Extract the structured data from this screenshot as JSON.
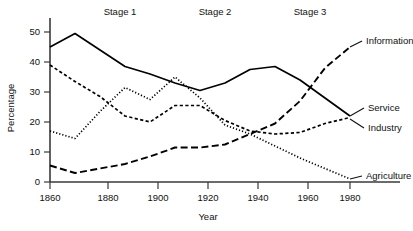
{
  "chart_data": {
    "type": "line",
    "title": "",
    "xlabel": "Year",
    "ylabel": "Percentage",
    "xlim": [
      1860,
      1980
    ],
    "ylim": [
      0,
      50
    ],
    "xticks": [
      1860,
      1880,
      1900,
      1920,
      1940,
      1960,
      1980
    ],
    "yticks": [
      0,
      10,
      20,
      30,
      40,
      50
    ],
    "grid": false,
    "legend_position": "right-inline-labels",
    "annotations": [
      {
        "text": "Stage 1",
        "x": 1875
      },
      {
        "text": "Stage 2",
        "x": 1920
      },
      {
        "text": "Stage 3",
        "x": 1958
      }
    ],
    "x": [
      1860,
      1870,
      1880,
      1890,
      1900,
      1910,
      1920,
      1930,
      1940,
      1950,
      1960,
      1970,
      1980
    ],
    "series": [
      {
        "name": "Service",
        "style": "solid",
        "values": [
          45,
          49.5,
          44,
          38.5,
          36,
          33,
          30.5,
          33,
          37.5,
          38.5,
          34,
          28,
          22
        ]
      },
      {
        "name": "Industry",
        "style": "dashed",
        "values": [
          39,
          33.5,
          28.5,
          22,
          20,
          25.5,
          25.5,
          20.5,
          17,
          16,
          16.5,
          19.5,
          21.5
        ]
      },
      {
        "name": "Agriculture",
        "style": "dotted",
        "values": [
          17,
          14.5,
          23.5,
          31.5,
          27.5,
          35,
          28,
          19,
          16,
          12,
          8,
          4.5,
          1
        ]
      },
      {
        "name": "Information",
        "style": "longdash",
        "values": [
          5.5,
          3,
          4.5,
          6,
          8.5,
          11.5,
          11.5,
          12.5,
          16,
          19.5,
          27,
          38,
          45
        ]
      }
    ]
  },
  "labels": {
    "stage1": "Stage 1",
    "stage2": "Stage 2",
    "stage3": "Stage 3",
    "ylabel": "Percentage",
    "xlabel": "Year",
    "series_information": "Information",
    "series_service": "Service",
    "series_industry": "Industry",
    "series_agriculture": "Agriculture",
    "ytick_0": "0",
    "ytick_10": "10",
    "ytick_20": "20",
    "ytick_30": "30",
    "ytick_40": "40",
    "ytick_50": "50",
    "xtick_1860": "1860",
    "xtick_1880": "1880",
    "xtick_1900": "1900",
    "xtick_1920": "1920",
    "xtick_1940": "1940",
    "xtick_1960": "1960",
    "xtick_1980": "1980"
  },
  "colors": {
    "line": "#000000",
    "axis": "#3a3a3a",
    "text": "#111111",
    "background": "#ffffff"
  }
}
